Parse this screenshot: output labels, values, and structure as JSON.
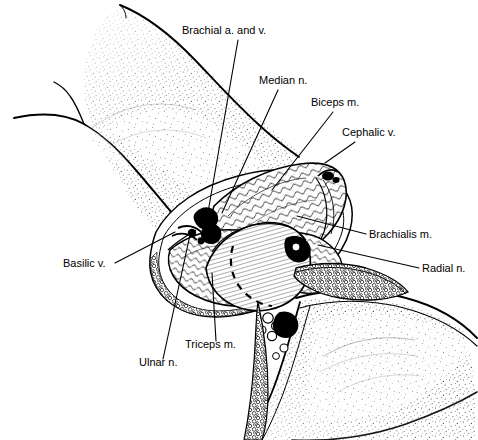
{
  "figure": {
    "style": "black-and-white pen-and-ink line drawing with stipple shading",
    "background_color": "#ffffff",
    "line_color": "#000000",
    "width": 478,
    "height": 440
  },
  "labels": [
    {
      "id": "brachial",
      "text": "Brachial a. and v.",
      "x": 182,
      "y": 34,
      "anchor": "start",
      "leader": [
        [
          238,
          40
        ],
        [
          207,
          218
        ]
      ]
    },
    {
      "id": "median",
      "text": "Median n.",
      "x": 259,
      "y": 84,
      "anchor": "start",
      "leader": [
        [
          278,
          90
        ],
        [
          222,
          213
        ]
      ]
    },
    {
      "id": "biceps",
      "text": "Biceps m.",
      "x": 311,
      "y": 106,
      "anchor": "start",
      "leader": [
        [
          333,
          112
        ],
        [
          272,
          190
        ]
      ]
    },
    {
      "id": "cephalic",
      "text": "Cephalic v.",
      "x": 342,
      "y": 136,
      "anchor": "start",
      "leader": [
        [
          355,
          142
        ],
        [
          325,
          163
        ]
      ]
    },
    {
      "id": "brachialis",
      "text": "Brachialis m.",
      "x": 369,
      "y": 238,
      "anchor": "start",
      "leader": [
        [
          366,
          234
        ],
        [
          297,
          216
        ]
      ]
    },
    {
      "id": "radial",
      "text": "Radial n.",
      "x": 422,
      "y": 272,
      "anchor": "start",
      "leader": [
        [
          419,
          268
        ],
        [
          318,
          245
        ]
      ]
    },
    {
      "id": "basilic",
      "text": "Basilic v.",
      "x": 63,
      "y": 267,
      "anchor": "start",
      "leader": [
        [
          115,
          263
        ],
        [
          175,
          232
        ]
      ]
    },
    {
      "id": "triceps",
      "text": "Triceps m.",
      "x": 185,
      "y": 348,
      "anchor": "start",
      "leader": [
        [
          216,
          341
        ],
        [
          212,
          273
        ]
      ]
    },
    {
      "id": "ulnar",
      "text": "Ulnar n.",
      "x": 139,
      "y": 366,
      "anchor": "start",
      "leader": [
        [
          163,
          359
        ],
        [
          190,
          235
        ]
      ]
    }
  ],
  "anatomy_notes": {
    "dashed_line": "dashed incision/retraction line across biceps muscle belly",
    "regions": [
      "upper arm skin with stipple shading (upper left)",
      "opened surgical field exposing biceps, brachialis and triceps muscles",
      "forearm skin with stipple shading (lower right)",
      "skin flap edges with subcutaneous fat stipple border"
    ]
  }
}
